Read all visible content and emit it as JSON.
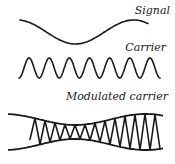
{
  "diagram": {
    "topic": "Amplitude modulation",
    "labels": {
      "signal": "Signal",
      "carrier": "Carrier",
      "modulated": "Modulated carrier"
    },
    "waves": {
      "signal": {
        "cycles": 1.1,
        "description": "low-frequency sine"
      },
      "carrier": {
        "cycles": 7,
        "description": "high-frequency constant-amplitude sine"
      },
      "modulated": {
        "carrier_cycles": 13,
        "description": "carrier whose amplitude follows the signal envelope"
      }
    },
    "colors": {
      "line": "#1a1a1a",
      "text": "#222222",
      "background": "#ffffff"
    }
  }
}
